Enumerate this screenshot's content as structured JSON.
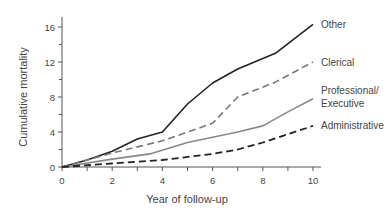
{
  "chart_data": {
    "type": "line",
    "title": "",
    "xlabel": "Year of follow-up",
    "ylabel": "Cumulative mortality",
    "xlim": [
      0,
      10
    ],
    "ylim": [
      0,
      16
    ],
    "x_ticks": [
      0,
      2,
      4,
      6,
      8,
      10
    ],
    "y_ticks": [
      0,
      4,
      8,
      12,
      16
    ],
    "grid": false,
    "legend_position": "inline-right",
    "series": [
      {
        "name": "Other",
        "label_lines": [
          "Other"
        ],
        "style": "solid",
        "color": "#222222",
        "width": 1.6,
        "points": [
          [
            0,
            0
          ],
          [
            1,
            0.8
          ],
          [
            2,
            1.8
          ],
          [
            3,
            3.2
          ],
          [
            4,
            4.0
          ],
          [
            5,
            7.2
          ],
          [
            6,
            9.6
          ],
          [
            7,
            11.2
          ],
          [
            8.5,
            13.0
          ],
          [
            10,
            16.3
          ]
        ]
      },
      {
        "name": "Clerical",
        "label_lines": [
          "Clerical"
        ],
        "style": "dashed",
        "color": "#777777",
        "width": 1.6,
        "points": [
          [
            0,
            0
          ],
          [
            2,
            1.6
          ],
          [
            4,
            3.0
          ],
          [
            6,
            5.0
          ],
          [
            7,
            8.0
          ],
          [
            8.5,
            9.7
          ],
          [
            10,
            12.0
          ]
        ]
      },
      {
        "name": "Professional/ Executive",
        "label_lines": [
          "Professional/",
          "Executive"
        ],
        "style": "solid",
        "color": "#888888",
        "width": 1.6,
        "points": [
          [
            0,
            0
          ],
          [
            2,
            0.9
          ],
          [
            3.5,
            1.5
          ],
          [
            5,
            2.8
          ],
          [
            7,
            4.0
          ],
          [
            8,
            4.7
          ],
          [
            9,
            6.3
          ],
          [
            10,
            7.8
          ]
        ]
      },
      {
        "name": "Administrative",
        "label_lines": [
          "Administrative"
        ],
        "style": "dashed",
        "color": "#222222",
        "width": 1.8,
        "points": [
          [
            0,
            0
          ],
          [
            2,
            0.4
          ],
          [
            4,
            0.8
          ],
          [
            6,
            1.5
          ],
          [
            7,
            2.0
          ],
          [
            8,
            2.8
          ],
          [
            10,
            4.7
          ]
        ]
      }
    ]
  }
}
